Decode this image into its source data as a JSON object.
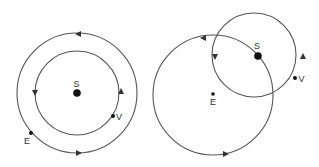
{
  "diagrams": [
    {
      "name": "heliocentric-view",
      "labels": {
        "sun": "S",
        "venus": "V",
        "earth": "E"
      }
    },
    {
      "name": "geocentric-view",
      "labels": {
        "sun": "S",
        "venus": "V",
        "earth": "E"
      }
    }
  ],
  "colors": {
    "line": "#555555",
    "dot": "#111111",
    "background": "#ffffff"
  }
}
